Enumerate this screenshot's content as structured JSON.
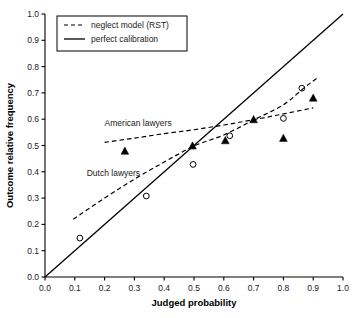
{
  "chart_data": {
    "type": "scatter",
    "title": "",
    "xlabel": "Judged probability",
    "ylabel": "Outcome relative frequency",
    "xlim": [
      0.0,
      1.0
    ],
    "ylim": [
      0.0,
      1.0
    ],
    "grid": false,
    "xticks": [
      "0.0",
      "0.1",
      "0.2",
      "0.3",
      "0.4",
      "0.5",
      "0.6",
      "0.7",
      "0.8",
      "0.9",
      "1.0"
    ],
    "yticks": [
      "0.0",
      "0.1",
      "0.2",
      "0.3",
      "0.4",
      "0.5",
      "0.6",
      "0.7",
      "0.8",
      "0.9",
      "1.0"
    ],
    "xtick_values": [
      0.0,
      0.1,
      0.2,
      0.3,
      0.4,
      0.5,
      0.6,
      0.7,
      0.8,
      0.9,
      1.0
    ],
    "ytick_values": [
      0.0,
      0.1,
      0.2,
      0.3,
      0.4,
      0.5,
      0.6,
      0.7,
      0.8,
      0.9,
      1.0
    ],
    "legend": {
      "position": "upper-left",
      "entries": [
        {
          "label": "neglect model (RST)",
          "style": "dashed"
        },
        {
          "label": "perfect calibration",
          "style": "solid"
        }
      ]
    },
    "annotations": [
      {
        "text": "American lawyers",
        "x": 0.2,
        "y": 0.575
      },
      {
        "text": "Dutch lawyers",
        "x": 0.14,
        "y": 0.385
      }
    ],
    "series": [
      {
        "name": "American lawyers",
        "marker": "filled-triangle",
        "color": "#000000",
        "points": [
          {
            "x": 0.268,
            "y": 0.478
          },
          {
            "x": 0.495,
            "y": 0.498
          },
          {
            "x": 0.605,
            "y": 0.518
          },
          {
            "x": 0.7,
            "y": 0.598
          },
          {
            "x": 0.8,
            "y": 0.527
          },
          {
            "x": 0.9,
            "y": 0.68
          }
        ]
      },
      {
        "name": "Dutch lawyers",
        "marker": "open-circle",
        "color": "#000000",
        "points": [
          {
            "x": 0.117,
            "y": 0.148
          },
          {
            "x": 0.34,
            "y": 0.308
          },
          {
            "x": 0.497,
            "y": 0.428
          },
          {
            "x": 0.62,
            "y": 0.537
          },
          {
            "x": 0.8,
            "y": 0.603
          },
          {
            "x": 0.862,
            "y": 0.718
          }
        ]
      }
    ],
    "curves": [
      {
        "name": "neglect model (RST) - American lawyers",
        "style": "dashed",
        "color": "#000000",
        "points": [
          {
            "x": 0.2,
            "y": 0.512
          },
          {
            "x": 0.3,
            "y": 0.528
          },
          {
            "x": 0.4,
            "y": 0.545
          },
          {
            "x": 0.5,
            "y": 0.56
          },
          {
            "x": 0.6,
            "y": 0.578
          },
          {
            "x": 0.7,
            "y": 0.598
          },
          {
            "x": 0.8,
            "y": 0.62
          },
          {
            "x": 0.9,
            "y": 0.643
          }
        ]
      },
      {
        "name": "neglect model (RST) - Dutch lawyers",
        "style": "dashed",
        "color": "#000000",
        "points": [
          {
            "x": 0.095,
            "y": 0.22
          },
          {
            "x": 0.2,
            "y": 0.3
          },
          {
            "x": 0.3,
            "y": 0.372
          },
          {
            "x": 0.4,
            "y": 0.437
          },
          {
            "x": 0.5,
            "y": 0.498
          },
          {
            "x": 0.6,
            "y": 0.54
          },
          {
            "x": 0.7,
            "y": 0.597
          },
          {
            "x": 0.8,
            "y": 0.655
          },
          {
            "x": 0.87,
            "y": 0.72
          },
          {
            "x": 0.915,
            "y": 0.758
          }
        ]
      },
      {
        "name": "perfect calibration",
        "style": "solid",
        "color": "#000000",
        "points": [
          {
            "x": 0.0,
            "y": 0.0
          },
          {
            "x": 1.0,
            "y": 1.0
          }
        ]
      }
    ]
  }
}
